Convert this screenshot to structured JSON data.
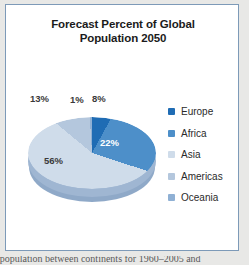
{
  "figure": {
    "title_line1": "Forecast Percent of Global",
    "title_line2": "Population 2050",
    "border_color": "#7d9ab8",
    "background": "#ffffff"
  },
  "caption": {
    "clipped_text": "f population between continents for 1960–2005 and"
  },
  "chart_data": {
    "type": "pie",
    "title": "Forecast Percent of Global Population 2050",
    "categories": [
      "Europe",
      "Africa",
      "Asia",
      "Americas",
      "Oceania"
    ],
    "values": [
      8,
      22,
      56,
      13,
      1
    ],
    "value_labels": [
      "8%",
      "22%",
      "56%",
      "13%",
      "1%"
    ],
    "unit": "percent",
    "colors": [
      "#1f6cb4",
      "#4d8fc9",
      "#cfdcea",
      "#b4c7dd",
      "#8fb0d4"
    ],
    "legend_position": "right",
    "three_d": true,
    "grid": false
  },
  "legend": {
    "items": [
      {
        "label": "Europe",
        "color": "#1f6cb4",
        "value": "8%"
      },
      {
        "label": "Africa",
        "color": "#4d8fc9",
        "value": "22%"
      },
      {
        "label": "Asia",
        "color": "#cfdcea",
        "value": "56%"
      },
      {
        "label": "Americas",
        "color": "#b4c7dd",
        "value": "13%"
      },
      {
        "label": "Oceania",
        "color": "#8fb0d4",
        "value": "1%"
      }
    ]
  },
  "slice_labels": {
    "americas": "13%",
    "oceania": "1%",
    "europe": "8%",
    "africa": "22%",
    "asia": "56%"
  }
}
